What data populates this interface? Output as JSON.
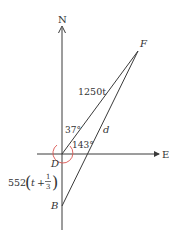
{
  "diagram": {
    "type": "navigation-vector-diagram",
    "axes": {
      "north_label": "N",
      "east_label": "E"
    },
    "points": {
      "D": {
        "label": "D"
      },
      "F": {
        "label": "F"
      },
      "B": {
        "label": "B"
      }
    },
    "segments": {
      "DF_label": "1250t",
      "BF_label": "d",
      "DB_label_prefix": "552",
      "DB_label_var": "t",
      "DB_label_plus": "+",
      "DB_label_frac_num": "1",
      "DB_label_frac_den": "3"
    },
    "angles": {
      "north_to_DF": "37°",
      "DF_to_south": "143°"
    },
    "colors": {
      "line": "#3a3a3a",
      "angle_arc": "#d9534f",
      "text": "#333333"
    }
  }
}
